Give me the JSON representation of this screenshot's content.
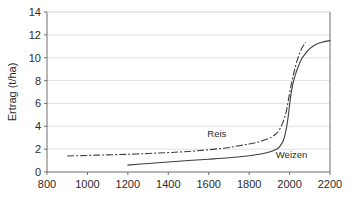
{
  "chart_data": {
    "type": "line",
    "title": "",
    "xlabel": "",
    "ylabel": "Ertrag (t/ha)",
    "xlim": [
      800,
      2200
    ],
    "ylim": [
      0,
      14
    ],
    "xticks": [
      800,
      1000,
      1200,
      1400,
      1600,
      1800,
      2000,
      2200
    ],
    "yticks": [
      0,
      2,
      4,
      6,
      8,
      10,
      12,
      14
    ],
    "grid": "horizontal",
    "legend_position": "inline-annotations",
    "background_color": "#ffffff",
    "gridline_color": "#d8d8d8",
    "axis_color": "#6e6e6e",
    "series": [
      {
        "name": "Reis",
        "style": "dash-dot",
        "color": "#3d3d3d",
        "label_x": 1640,
        "label_y": 3.05,
        "x": [
          900,
          1000,
          1100,
          1200,
          1300,
          1400,
          1500,
          1600,
          1700,
          1800,
          1850,
          1900,
          1930,
          1950,
          1970,
          1985,
          2000,
          2010,
          2020,
          2030,
          2040,
          2050,
          2060,
          2070,
          2080
        ],
        "y": [
          1.4,
          1.45,
          1.5,
          1.55,
          1.62,
          1.7,
          1.8,
          1.95,
          2.15,
          2.45,
          2.65,
          2.95,
          3.3,
          3.7,
          4.5,
          5.4,
          6.9,
          7.8,
          8.6,
          9.3,
          9.9,
          10.4,
          10.8,
          11.1,
          11.35
        ]
      },
      {
        "name": "Weizen",
        "style": "solid",
        "color": "#3d3d3d",
        "label_x": 2010,
        "label_y": 1.25,
        "x": [
          1200,
          1300,
          1400,
          1500,
          1600,
          1700,
          1800,
          1850,
          1900,
          1930,
          1950,
          1970,
          1985,
          1995,
          2005,
          2015,
          2025,
          2040,
          2060,
          2080,
          2100,
          2130,
          2160,
          2200
        ],
        "y": [
          0.6,
          0.75,
          0.88,
          1.0,
          1.12,
          1.25,
          1.42,
          1.55,
          1.75,
          1.95,
          2.2,
          2.8,
          3.9,
          5.1,
          6.6,
          7.6,
          8.3,
          9.1,
          9.9,
          10.4,
          10.8,
          11.15,
          11.35,
          11.5
        ]
      }
    ]
  },
  "plot_geometry": {
    "left": 47,
    "right": 330,
    "top": 12,
    "bottom": 172
  },
  "axis_labels": {
    "y_title": "Ertrag (t/ha)",
    "y_ticks": [
      "0",
      "2",
      "4",
      "6",
      "8",
      "10",
      "12",
      "14"
    ],
    "x_ticks": [
      "800",
      "1000",
      "1200",
      "1400",
      "1600",
      "1800",
      "2000",
      "2200"
    ]
  },
  "annotations": {
    "reis": "Reis",
    "weizen": "Weizen"
  }
}
